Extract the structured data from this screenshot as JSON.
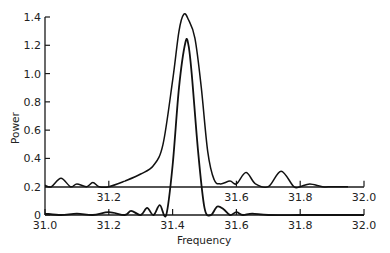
{
  "chart_data": {
    "type": "line",
    "title": "",
    "xlabel": "Frequency",
    "ylabel": "Power",
    "xlim": [
      31.0,
      32.0
    ],
    "ylim": [
      0,
      1.4
    ],
    "grid": false,
    "legend": null,
    "x_ticks": [
      "31.0",
      "31.2",
      "31.4",
      "31.6",
      "31.8",
      "32.0"
    ],
    "y_ticks": [
      "0",
      "0.2",
      "0.4",
      "0.6",
      "0.8",
      "1.0",
      "1.2",
      "1.4"
    ],
    "inner_axis": {
      "baseline": 0.2,
      "tick_labels": [
        "31.2",
        "31.6",
        "31.8",
        "32.0"
      ]
    },
    "series": [
      {
        "name": "broad spectrum (offset by 0.2)",
        "x": [
          31.0,
          31.02,
          31.05,
          31.08,
          31.1,
          31.13,
          31.15,
          31.17,
          31.2,
          31.25,
          31.3,
          31.34,
          31.37,
          31.4,
          31.42,
          31.435,
          31.45,
          31.47,
          31.49,
          31.51,
          31.53,
          31.55,
          31.58,
          31.6,
          31.63,
          31.66,
          31.7,
          31.74,
          31.78,
          31.8,
          31.83,
          31.87,
          31.9,
          31.95
        ],
        "y": [
          0.21,
          0.2,
          0.26,
          0.2,
          0.22,
          0.2,
          0.23,
          0.2,
          0.2,
          0.24,
          0.29,
          0.35,
          0.5,
          0.95,
          1.3,
          1.42,
          1.38,
          1.25,
          0.9,
          0.45,
          0.25,
          0.22,
          0.24,
          0.22,
          0.3,
          0.22,
          0.2,
          0.31,
          0.2,
          0.2,
          0.22,
          0.2,
          0.2,
          0.2
        ]
      },
      {
        "name": "narrow spectrum",
        "x": [
          31.0,
          31.05,
          31.1,
          31.15,
          31.2,
          31.25,
          31.27,
          31.3,
          31.32,
          31.34,
          31.36,
          31.38,
          31.4,
          31.42,
          31.44,
          31.45,
          31.46,
          31.48,
          31.5,
          31.52,
          31.54,
          31.56,
          31.58,
          31.6,
          31.62,
          31.65,
          31.7,
          31.8,
          31.9,
          32.0
        ],
        "y": [
          0.01,
          0.0,
          0.01,
          0.0,
          0.02,
          0.0,
          0.03,
          0.0,
          0.05,
          0.0,
          0.07,
          0.0,
          0.35,
          0.9,
          1.22,
          1.2,
          1.0,
          0.45,
          0.05,
          0.0,
          0.06,
          0.04,
          0.0,
          0.02,
          0.0,
          0.01,
          0.0,
          0.0,
          0.0,
          0.0
        ]
      }
    ]
  }
}
